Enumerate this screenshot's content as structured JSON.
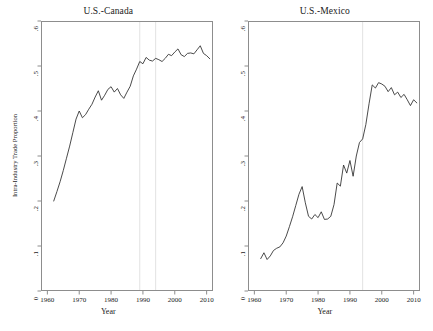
{
  "figure": {
    "axis_title_x": "Year",
    "axis_title_y": "Intra-Industry Trade Proportion"
  },
  "panels": {
    "left": {
      "title": "U.S.-Canada"
    },
    "right": {
      "title": "U.S.-Mexico"
    }
  },
  "chart_data": [
    {
      "type": "line",
      "title": "U.S.-Canada",
      "xlabel": "Year",
      "ylabel": "Intra-Industry Trade Proportion",
      "xlim": [
        1958,
        2012
      ],
      "ylim": [
        0,
        0.6
      ],
      "xticks": [
        1960,
        1970,
        1980,
        1990,
        2000,
        2010
      ],
      "xtick_labels": [
        "1960",
        "1970",
        "1980",
        "1990",
        "2000",
        "2010"
      ],
      "yticks": [
        0,
        0.1,
        0.2,
        0.3,
        0.4,
        0.5,
        0.6
      ],
      "ytick_labels": [
        "0",
        ".1",
        ".2",
        ".3",
        ".4",
        ".5",
        ".6"
      ],
      "grid": false,
      "legend": "none",
      "vlines": [
        1989,
        1994
      ],
      "x": [
        1962,
        1963,
        1964,
        1965,
        1966,
        1967,
        1968,
        1969,
        1970,
        1971,
        1972,
        1973,
        1974,
        1975,
        1976,
        1977,
        1978,
        1979,
        1980,
        1981,
        1982,
        1983,
        1984,
        1985,
        1986,
        1987,
        1988,
        1989,
        1990,
        1991,
        1992,
        1993,
        1994,
        1995,
        1996,
        1997,
        1998,
        1999,
        2000,
        2001,
        2002,
        2003,
        2004,
        2005,
        2006,
        2007,
        2008,
        2009,
        2010,
        2011
      ],
      "values": [
        0.2,
        0.221,
        0.243,
        0.268,
        0.295,
        0.322,
        0.352,
        0.382,
        0.4,
        0.385,
        0.392,
        0.404,
        0.415,
        0.431,
        0.445,
        0.424,
        0.435,
        0.448,
        0.454,
        0.442,
        0.45,
        0.436,
        0.428,
        0.442,
        0.455,
        0.478,
        0.493,
        0.51,
        0.505,
        0.519,
        0.513,
        0.511,
        0.517,
        0.514,
        0.51,
        0.517,
        0.526,
        0.523,
        0.531,
        0.538,
        0.525,
        0.521,
        0.528,
        0.529,
        0.527,
        0.536,
        0.545,
        0.528,
        0.523,
        0.516
      ]
    },
    {
      "type": "line",
      "title": "U.S.-Mexico",
      "xlabel": "Year",
      "ylabel": "Intra-Industry Trade Proportion",
      "xlim": [
        1958,
        2012
      ],
      "ylim": [
        0,
        0.6
      ],
      "xticks": [
        1960,
        1970,
        1980,
        1990,
        2000,
        2010
      ],
      "xtick_labels": [
        "1960",
        "1970",
        "1980",
        "1990",
        "2000",
        "2010"
      ],
      "yticks": [
        0,
        0.1,
        0.2,
        0.3,
        0.4,
        0.5,
        0.6
      ],
      "ytick_labels": [
        "0",
        ".1",
        ".2",
        ".3",
        ".4",
        ".5",
        ".6"
      ],
      "grid": false,
      "legend": "none",
      "vlines": [
        1994
      ],
      "x": [
        1962,
        1963,
        1964,
        1965,
        1966,
        1967,
        1968,
        1969,
        1970,
        1971,
        1972,
        1973,
        1974,
        1975,
        1976,
        1977,
        1978,
        1979,
        1980,
        1981,
        1982,
        1983,
        1984,
        1985,
        1986,
        1987,
        1988,
        1989,
        1990,
        1991,
        1992,
        1993,
        1994,
        1995,
        1996,
        1997,
        1998,
        1999,
        2000,
        2001,
        2002,
        2003,
        2004,
        2005,
        2006,
        2007,
        2008,
        2009,
        2010,
        2011
      ],
      "values": [
        0.072,
        0.085,
        0.07,
        0.078,
        0.09,
        0.095,
        0.098,
        0.107,
        0.122,
        0.143,
        0.165,
        0.19,
        0.215,
        0.232,
        0.196,
        0.166,
        0.16,
        0.17,
        0.163,
        0.176,
        0.159,
        0.16,
        0.166,
        0.192,
        0.24,
        0.233,
        0.28,
        0.262,
        0.29,
        0.255,
        0.3,
        0.33,
        0.338,
        0.37,
        0.416,
        0.458,
        0.451,
        0.463,
        0.46,
        0.455,
        0.443,
        0.452,
        0.436,
        0.442,
        0.43,
        0.437,
        0.425,
        0.412,
        0.425,
        0.418
      ]
    }
  ]
}
